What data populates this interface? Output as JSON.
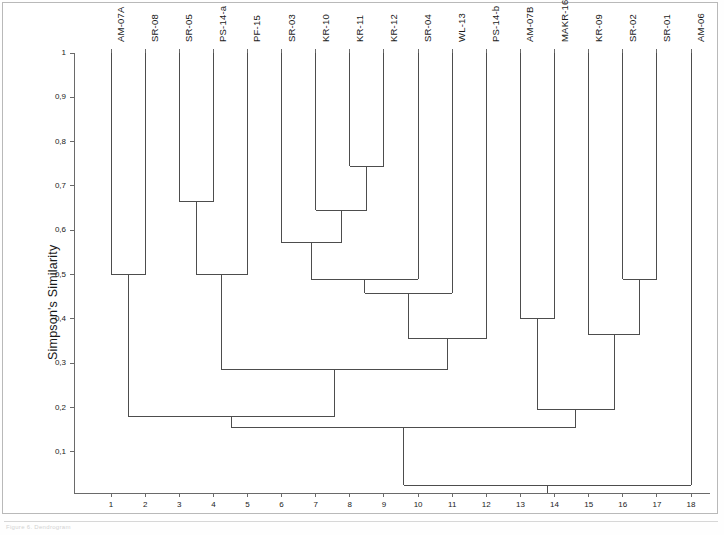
{
  "figure": {
    "caption": "Figure 6. Dendrogram"
  },
  "chart_data": {
    "type": "dendrogram",
    "title": "",
    "xlabel": "",
    "ylabel": "Simpson's Similarity",
    "ylim": [
      0.0,
      1.0
    ],
    "ytick_values": [
      1,
      0.9,
      0.8,
      0.7,
      0.6,
      0.5,
      0.4,
      0.3,
      0.2,
      0.1
    ],
    "ytick_labels": [
      "1",
      "0,9",
      "0,8",
      "0,7",
      "0,6",
      "0,5",
      "0,4",
      "0,3",
      "0,2",
      "0,1"
    ],
    "xtick_labels": [
      "1",
      "2",
      "3",
      "4",
      "5",
      "6",
      "7",
      "8",
      "9",
      "10",
      "11",
      "12",
      "13",
      "14",
      "15",
      "16",
      "17",
      "18"
    ],
    "grid": false,
    "legend": null,
    "orientation": "vertical-top-down",
    "leaf_labels": [
      "AM-07A",
      "SR-08",
      "SR-05",
      "PS-14-a",
      "PF-15",
      "SR-03",
      "KR-10",
      "KR-11",
      "KR-12",
      "SR-04",
      "WL-13",
      "PS-14-b",
      "AM-07B",
      "MAKR-16",
      "KR-09",
      "SR-02",
      "SR-01",
      "AM-06"
    ],
    "leaf_positions": [
      1,
      2,
      3,
      4,
      5,
      6,
      7,
      8,
      9,
      10,
      11,
      12,
      13,
      14,
      15,
      16,
      17,
      18
    ],
    "merges": [
      {
        "id": "m1",
        "left": "AM-07A",
        "right": "SR-08",
        "height": 0.5
      },
      {
        "id": "m2",
        "left": "SR-05",
        "right": "PS-14-a",
        "height": 0.665
      },
      {
        "id": "m3",
        "left": "m2",
        "right": "PF-15",
        "height": 0.5
      },
      {
        "id": "m4",
        "left": "KR-11",
        "right": "KR-12",
        "height": 0.745
      },
      {
        "id": "m5",
        "left": "KR-10",
        "right": "m4",
        "height": 0.645
      },
      {
        "id": "m6",
        "left": "SR-03",
        "right": "m5",
        "height": 0.572
      },
      {
        "id": "m7",
        "left": "m6",
        "right": "SR-04",
        "height": 0.49
      },
      {
        "id": "m8",
        "left": "m7",
        "right": "WL-13",
        "height": 0.458
      },
      {
        "id": "m9",
        "left": "m8",
        "right": "PS-14-b",
        "height": 0.355
      },
      {
        "id": "m10",
        "left": "m3",
        "right": "m9",
        "height": 0.285
      },
      {
        "id": "m11",
        "left": "m1",
        "right": "m10",
        "height": 0.18
      },
      {
        "id": "m12",
        "left": "AM-07B",
        "right": "MAKR-16",
        "height": 0.4
      },
      {
        "id": "m13",
        "left": "SR-02",
        "right": "SR-01",
        "height": 0.49
      },
      {
        "id": "m14",
        "left": "KR-09",
        "right": "m13",
        "height": 0.365
      },
      {
        "id": "m15",
        "left": "m12",
        "right": "m14",
        "height": 0.195
      },
      {
        "id": "m16",
        "left": "m11",
        "right": "m15",
        "height": 0.155
      },
      {
        "id": "m17",
        "left": "m16",
        "right": "AM-06",
        "height": 0.025
      }
    ]
  }
}
